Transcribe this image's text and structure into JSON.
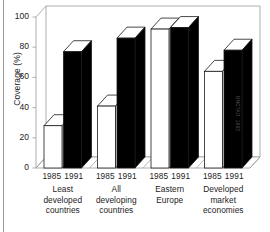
{
  "chart_data": {
    "type": "bar",
    "title": "",
    "subtitle": "",
    "xlabel": "",
    "ylabel": "Coverage (%)",
    "ylim": [
      0,
      100
    ],
    "yticks": [
      0,
      20,
      40,
      60,
      80,
      100
    ],
    "ytick_labels": [
      "0",
      "20",
      "40",
      "60",
      "80",
      "100"
    ],
    "grid": false,
    "legend": "none",
    "style": "3d-grouped-bars",
    "categories": [
      "Least developed countries",
      "All developing countries",
      "Eastern Europe",
      "Developed market economies"
    ],
    "category_lines": [
      [
        "Least",
        "developed",
        "countries"
      ],
      [
        "All",
        "developing",
        "countries"
      ],
      [
        "Eastern",
        "Europe"
      ],
      [
        "Developed",
        "market",
        "economies"
      ]
    ],
    "series": [
      {
        "name": "1985",
        "color": "#ffffff",
        "values": [
          28,
          41,
          92,
          64
        ]
      },
      {
        "name": "1991",
        "color": "#000000",
        "values": [
          77,
          86,
          93,
          78
        ]
      }
    ],
    "bar_year_labels": [
      "1985",
      "1991"
    ],
    "annotations": [
      "UNCTAD, 1993"
    ],
    "source_credit": "UNCTAD, 1993"
  },
  "axis": {
    "y_title": "Coverage (%)",
    "tick_100": "100",
    "tick_80": "80",
    "tick_60": "60",
    "tick_40": "40",
    "tick_20": "20",
    "tick_0": "0"
  },
  "groups": [
    {
      "year_first": "1985",
      "year_second": "1991",
      "line1": "Least",
      "line2": "developed",
      "line3": "countries"
    },
    {
      "year_first": "1985",
      "year_second": "1991",
      "line1": "All",
      "line2": "developing",
      "line3": "countries"
    },
    {
      "year_first": "1985",
      "year_second": "1991",
      "line1": "Eastern",
      "line2": "Europe",
      "line3": ""
    },
    {
      "year_first": "1985",
      "year_second": "1991",
      "line1": "Developed",
      "line2": "market",
      "line3": "economies"
    }
  ],
  "credit": {
    "text": "UNCTAD, 1993"
  },
  "colors": {
    "bar_1985": "#ffffff",
    "bar_1991": "#000000",
    "outline": "#1a1a1a",
    "frame": "#9a9a9a",
    "text": "#1c1c1c"
  }
}
